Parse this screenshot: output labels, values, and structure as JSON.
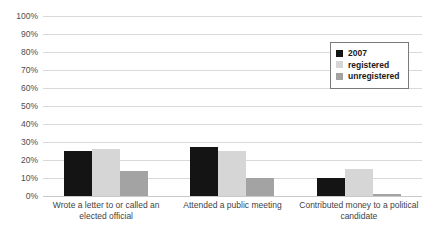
{
  "chart_data": {
    "type": "bar",
    "title": "",
    "subtitle": "",
    "xlabel": "",
    "ylabel": "",
    "ylim": [
      0,
      100
    ],
    "ytick_labels": [
      "100%",
      "90%",
      "80%",
      "70%",
      "60%",
      "50%",
      "40%",
      "30%",
      "20%",
      "10%",
      "0%"
    ],
    "ytick_values": [
      100,
      90,
      80,
      70,
      60,
      50,
      40,
      30,
      20,
      10,
      0
    ],
    "grid": true,
    "legend_position": "top-right",
    "categories": [
      "Wrote a letter to or called an elected official",
      "Attended a public meeting",
      "Contributed money to a political candidate"
    ],
    "series": [
      {
        "name": "2007",
        "color": "#141414",
        "values": [
          25,
          27,
          10
        ]
      },
      {
        "name": "registered",
        "color": "#d6d6d6",
        "values": [
          26,
          25,
          15
        ]
      },
      {
        "name": "unregistered",
        "color": "#a3a3a3",
        "values": [
          14,
          10,
          1
        ]
      }
    ]
  },
  "legend": {
    "items": [
      {
        "label": "2007"
      },
      {
        "label": "registered"
      },
      {
        "label": "unregistered"
      }
    ]
  }
}
